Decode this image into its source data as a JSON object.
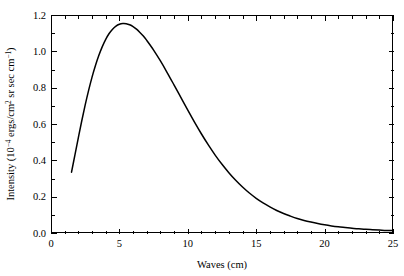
{
  "chart_data": {
    "type": "line",
    "title": "",
    "subtitle": "",
    "xlabel": "Waves (cm)",
    "ylabel": "Intensity (10−4 ergs/cm2 sr sec cm−1)",
    "ylabel_parts": {
      "lead": "Intensity (10",
      "sup1": "−4",
      "mid": " ergs/cm",
      "sup2": "2",
      "tail": " sr sec cm",
      "sup3": "−1",
      "close": ")"
    },
    "xlim": [
      0,
      25
    ],
    "ylim": [
      0.0,
      1.2
    ],
    "x_major_ticks": [
      0,
      5,
      10,
      15,
      20,
      25
    ],
    "x_major_tick_labels": [
      "0",
      "5",
      "10",
      "15",
      "20",
      "25"
    ],
    "x_minor_tick_step": 1,
    "y_major_ticks": [
      0.0,
      0.2,
      0.4,
      0.6,
      0.8,
      1.0,
      1.2
    ],
    "y_major_tick_labels": [
      "0.0",
      "0.2",
      "0.4",
      "0.6",
      "0.8",
      "1.0",
      "1.2"
    ],
    "y_minor_tick_step": 0.1,
    "grid": false,
    "legend": null,
    "legend_position": "none",
    "frame": "box",
    "tick_direction": "in",
    "ticks_all_sides": true,
    "series": [
      {
        "name": "intensity",
        "color": "#000000",
        "line_width": 1.5,
        "x": [
          1.5,
          1.75,
          2.0,
          2.25,
          2.5,
          2.75,
          3.0,
          3.25,
          3.5,
          3.75,
          4.0,
          4.25,
          4.5,
          4.75,
          5.0,
          5.25,
          5.5,
          5.75,
          6.0,
          6.25,
          6.5,
          6.75,
          7.0,
          7.5,
          8.0,
          8.5,
          9.0,
          9.5,
          10.0,
          10.5,
          11.0,
          11.5,
          12.0,
          12.5,
          13.0,
          13.5,
          14.0,
          14.5,
          15.0,
          15.5,
          16.0,
          16.5,
          17.0,
          17.5,
          18.0,
          18.5,
          19.0,
          19.5,
          20.0,
          20.5,
          21.0,
          21.5,
          22.0,
          22.5,
          23.0,
          23.5,
          24.0,
          24.5,
          25.0
        ],
        "y": [
          0.335,
          0.43,
          0.525,
          0.618,
          0.705,
          0.785,
          0.858,
          0.922,
          0.978,
          1.026,
          1.066,
          1.098,
          1.122,
          1.139,
          1.149,
          1.153,
          1.152,
          1.146,
          1.136,
          1.122,
          1.104,
          1.084,
          1.06,
          1.007,
          0.947,
          0.882,
          0.814,
          0.745,
          0.676,
          0.609,
          0.545,
          0.485,
          0.429,
          0.378,
          0.332,
          0.29,
          0.253,
          0.22,
          0.191,
          0.166,
          0.144,
          0.124,
          0.107,
          0.093,
          0.08,
          0.069,
          0.06,
          0.052,
          0.045,
          0.039,
          0.034,
          0.03,
          0.026,
          0.023,
          0.02,
          0.018,
          0.016,
          0.014,
          0.013
        ],
        "peak_x": 5.3,
        "peak_y": 1.153,
        "start_x": 1.5,
        "start_y": 0.335,
        "end_x": 25.0,
        "end_y": 0.013
      }
    ]
  },
  "figure": {
    "background_color": "#ffffff",
    "axis_color": "#000000",
    "plot_left_px": 51,
    "plot_right_px": 393,
    "plot_top_px": 15,
    "plot_bottom_px": 233
  }
}
